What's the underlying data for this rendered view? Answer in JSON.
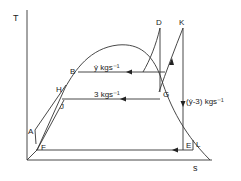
{
  "diagram": {
    "type": "temperature-entropy (T-s) cycle diagram",
    "axes": {
      "y_label": "T",
      "x_label": "s"
    },
    "points": {
      "A": "A",
      "B": "B",
      "D": "D",
      "E": "E",
      "F": "F",
      "G": "G",
      "H": "H",
      "J": "J",
      "K": "K",
      "L": "L"
    },
    "flows": {
      "upper": "ẏ kgs⁻¹",
      "middle": "3 kgs⁻¹",
      "side": "(ẏ-3) kgs⁻¹"
    },
    "colors": {
      "line": "#333333",
      "background": "#ffffff"
    }
  }
}
